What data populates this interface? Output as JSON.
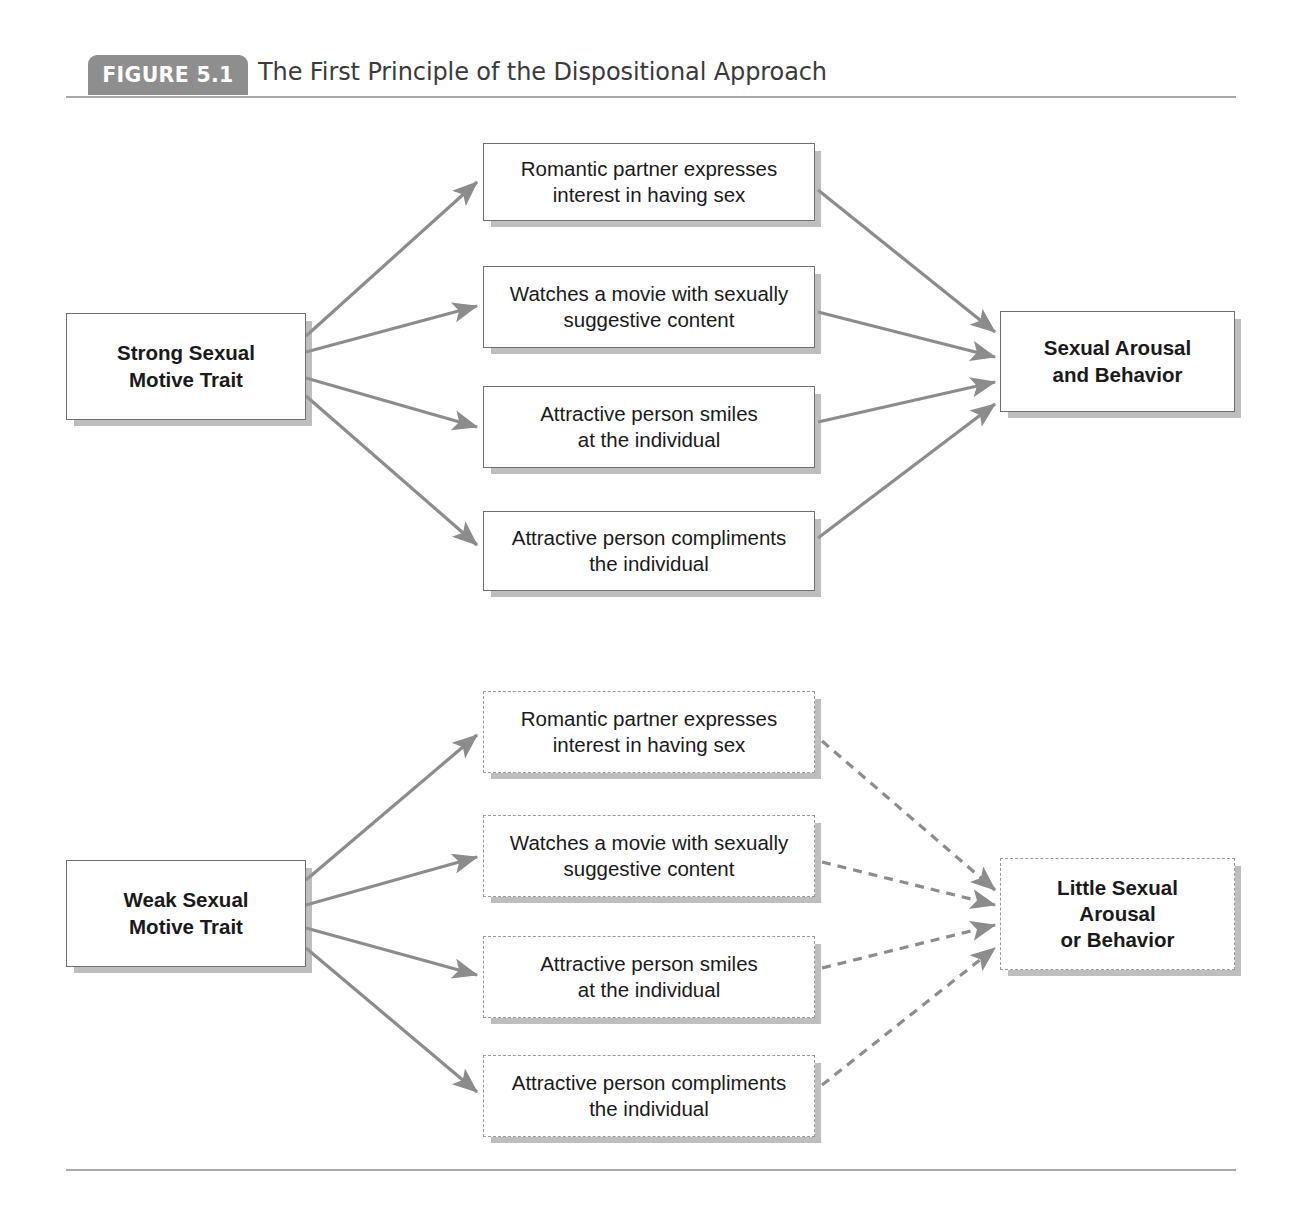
{
  "figure": {
    "badge_label": "FIGURE 5.1",
    "title": "The First Principle of the Dispositional Approach"
  },
  "colors": {
    "badge_background": "#8e8e8e",
    "badge_text": "#ffffff",
    "title_text": "#3a3a3a",
    "rule": "#a8a8a8",
    "arrow": "#8c8c8c",
    "box_border_solid": "#6f6f6f",
    "box_border_dashed": "#9a9a9a",
    "box_shadow": "#969696",
    "box_fill": "#ffffff",
    "text": "#1a1a1a"
  },
  "panels": {
    "top": {
      "trait": "Strong Sexual\nMotive Trait",
      "trait_lines": [
        "Strong Sexual",
        "Motive Trait"
      ],
      "outcome": "Sexual Arousal\nand Behavior",
      "outcome_lines": [
        "Sexual Arousal",
        "and Behavior"
      ],
      "situations": [
        {
          "lines": [
            "Romantic partner expresses",
            "interest in having sex"
          ]
        },
        {
          "lines": [
            "Watches a movie with sexually",
            "suggestive content"
          ]
        },
        {
          "lines": [
            "Attractive person smiles",
            "at the individual"
          ]
        },
        {
          "lines": [
            "Attractive person compliments",
            "the individual"
          ]
        }
      ],
      "box_style": "solid",
      "arrow_style": "solid"
    },
    "bottom": {
      "trait": "Weak Sexual\nMotive Trait",
      "trait_lines": [
        "Weak Sexual",
        "Motive Trait"
      ],
      "outcome": "Little Sexual\nArousal\nor Behavior",
      "outcome_lines": [
        "Little Sexual",
        "Arousal",
        "or Behavior"
      ],
      "situations": [
        {
          "lines": [
            "Romantic partner expresses",
            "interest in having sex"
          ]
        },
        {
          "lines": [
            "Watches a movie with sexually",
            "suggestive content"
          ]
        },
        {
          "lines": [
            "Attractive person smiles",
            "at the individual"
          ]
        },
        {
          "lines": [
            "Attractive person compliments",
            "the individual"
          ]
        }
      ],
      "box_style": "dashed",
      "arrow_style": "dashed"
    }
  },
  "diagram_data": {
    "type": "flow-diagram",
    "description": "Two parallel causal flow panels. A trait node on the left fans out to four situation nodes, which converge on a single outcome node on the right.",
    "top_panel_flow": "Strong Sexual Motive Trait -> four situations -> Sexual Arousal and Behavior (solid boxes, solid arrows)",
    "bottom_panel_flow": "Weak Sexual Motive Trait -> four situations -> Little Sexual Arousal or Behavior (dashed boxes, dashed arrows)"
  }
}
